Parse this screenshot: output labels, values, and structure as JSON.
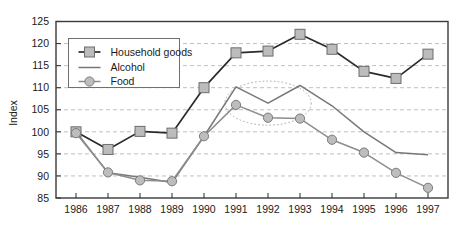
{
  "chart_data": {
    "type": "line",
    "title": "",
    "subtitle": "",
    "xlabel": "",
    "ylabel": "Index",
    "categories": [
      "1986",
      "1987",
      "1988",
      "1989",
      "1990",
      "1991",
      "1992",
      "1993",
      "1994",
      "1995",
      "1996",
      "1997"
    ],
    "x": [
      1986,
      1987,
      1988,
      1989,
      1990,
      1991,
      1992,
      1993,
      1994,
      1995,
      1996,
      1997
    ],
    "ylim": [
      85,
      125
    ],
    "yticks": [
      85,
      90,
      95,
      100,
      105,
      110,
      115,
      120,
      125
    ],
    "ytick_labels": [
      "85",
      "90",
      "95",
      "100",
      "105",
      "110",
      "115",
      "120",
      "125"
    ],
    "grid": true,
    "grid_axis": "y",
    "grid_style": "dashed",
    "legend_position": "upper-left-inside",
    "series": [
      {
        "name": "Household goods",
        "marker": "square",
        "color": "#2b2b2b",
        "marker_color": "#bcbcbc",
        "values": [
          100.0,
          96.0,
          100.1,
          99.7,
          110.0,
          117.9,
          118.3,
          122.1,
          118.7,
          113.7,
          112.1,
          117.6
        ]
      },
      {
        "name": "Alcohol",
        "marker": "none",
        "color": "#777777",
        "marker_color": "#777777",
        "values": [
          100.0,
          90.7,
          89.7,
          88.5,
          99.0,
          110.2,
          106.5,
          110.5,
          105.9,
          100.0,
          95.3,
          94.8
        ]
      },
      {
        "name": "Food",
        "marker": "circle",
        "color": "#8d8d8d",
        "marker_color": "#bdbdbd",
        "values": [
          99.7,
          90.8,
          89.0,
          88.8,
          99.0,
          106.1,
          103.2,
          103.0,
          98.2,
          95.3,
          90.7,
          87.3
        ]
      }
    ],
    "annotations": [
      {
        "type": "ellipse",
        "name": "highlight-ellipse",
        "x_center": 1992.0,
        "y_center": 106.5,
        "x_radius": 1.35,
        "y_radius": 5.0,
        "style": "dotted"
      }
    ]
  },
  "legend": {
    "entries": [
      {
        "label": "Household goods",
        "marker": "square-with-line"
      },
      {
        "label": "Alcohol",
        "marker": "line"
      },
      {
        "label": "Food",
        "marker": "circle-with-line"
      }
    ]
  },
  "axes": {
    "y_title": "Index"
  },
  "colors": {
    "household_goods_line": "#2b2b2b",
    "household_goods_marker": "#bcbcbc",
    "alcohol_line": "#777777",
    "food_line": "#8d8d8d",
    "food_marker": "#bdbdbd",
    "gridline": "#b9b9b9",
    "border": "#3a3a3a",
    "annotation": "#a9a9a9",
    "background": "#ffffff",
    "text": "#1a1a1a"
  }
}
